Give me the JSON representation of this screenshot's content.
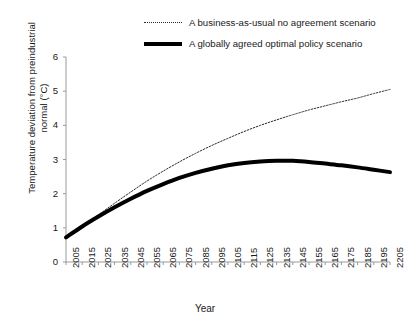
{
  "chart_data": {
    "type": "line",
    "title": "",
    "xlabel": "Year",
    "ylabel": "Temperature deviation from preindustrial normal (°C)",
    "xlim": [
      2005,
      2205
    ],
    "ylim": [
      0,
      6
    ],
    "grid": false,
    "legend_position": "top",
    "categories": [
      2005,
      2015,
      2025,
      2035,
      2045,
      2055,
      2065,
      2075,
      2085,
      2095,
      2105,
      2115,
      2125,
      2135,
      2145,
      2155,
      2165,
      2175,
      2185,
      2195,
      2205
    ],
    "xticks": [
      "2005",
      "2015",
      "2025",
      "2035",
      "2045",
      "2055",
      "2065",
      "2075",
      "2085",
      "2095",
      "2105",
      "2115",
      "2125",
      "2135",
      "2145",
      "2155",
      "2165",
      "2175",
      "2185",
      "2195",
      "2205"
    ],
    "yticks": [
      "0",
      "1",
      "2",
      "3",
      "4",
      "5",
      "6"
    ],
    "series": [
      {
        "name": "A business-as-usual no agreement scenario",
        "style": "dotted",
        "color": "#2b2b2b",
        "width": 1,
        "values": [
          0.72,
          1.05,
          1.38,
          1.72,
          2.05,
          2.37,
          2.66,
          2.93,
          3.18,
          3.41,
          3.62,
          3.82,
          4.0,
          4.16,
          4.31,
          4.45,
          4.57,
          4.69,
          4.8,
          4.93,
          5.05
        ]
      },
      {
        "name": "A globally agreed optimal policy scenario",
        "style": "solid",
        "color": "#000000",
        "width": 4,
        "values": [
          0.72,
          1.04,
          1.33,
          1.6,
          1.85,
          2.08,
          2.28,
          2.46,
          2.61,
          2.73,
          2.83,
          2.9,
          2.94,
          2.96,
          2.96,
          2.93,
          2.88,
          2.83,
          2.77,
          2.7,
          2.63
        ]
      }
    ]
  },
  "legend": {
    "items": [
      {
        "label": "A business-as-usual no agreement scenario",
        "style": "dotted"
      },
      {
        "label": "A globally agreed optimal policy scenario",
        "style": "solid"
      }
    ]
  },
  "axes": {
    "x_title": "Year",
    "y_title": "Temperature deviation from preindustrial normal (°C)"
  },
  "colors": {
    "background": "#ffffff",
    "axis": "#9a9a9a",
    "text": "#1a1a1a",
    "series_solid": "#000000",
    "series_dotted": "#2b2b2b"
  }
}
